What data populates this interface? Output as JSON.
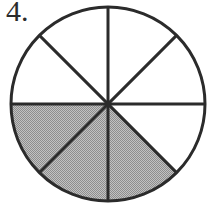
{
  "figure": {
    "problem_number": "4.",
    "type": "fraction-circle"
  },
  "chart_data": {
    "type": "pie",
    "title": "",
    "subtitle": "",
    "xlabel": "",
    "ylabel": "",
    "legend": [],
    "annotations": [
      "4."
    ],
    "grid": false,
    "total_slices": 8,
    "shaded_slices": 3,
    "unshaded_slices": 5,
    "fraction_shaded": "3/8",
    "slice_angle_degrees": 45,
    "categories": [
      "sector-1",
      "sector-2",
      "sector-3",
      "sector-4",
      "sector-5",
      "sector-6",
      "sector-7",
      "sector-8"
    ],
    "values": [
      45,
      45,
      45,
      45,
      45,
      45,
      45,
      45
    ],
    "slices": [
      {
        "name": "sector-1",
        "start_deg": 0,
        "end_deg": 45,
        "shaded": false
      },
      {
        "name": "sector-2",
        "start_deg": 45,
        "end_deg": 90,
        "shaded": true
      },
      {
        "name": "sector-3",
        "start_deg": 90,
        "end_deg": 135,
        "shaded": true
      },
      {
        "name": "sector-4",
        "start_deg": 135,
        "end_deg": 180,
        "shaded": true
      },
      {
        "name": "sector-5",
        "start_deg": 180,
        "end_deg": 225,
        "shaded": false
      },
      {
        "name": "sector-6",
        "start_deg": 225,
        "end_deg": 270,
        "shaded": false
      },
      {
        "name": "sector-7",
        "start_deg": 270,
        "end_deg": 315,
        "shaded": false
      },
      {
        "name": "sector-8",
        "start_deg": 315,
        "end_deg": 360,
        "shaded": false
      }
    ]
  },
  "geometry": {
    "center_x": 108,
    "center_y": 104,
    "radius": 97,
    "stroke_width": 3
  },
  "colors": {
    "shaded_fill": "#a9a9a9",
    "unshaded_fill": "#ffffff",
    "outline": "#2b2b2b",
    "divider": "#2b2b2b",
    "background": "#ffffff",
    "number_text": "#2b2b2b"
  }
}
